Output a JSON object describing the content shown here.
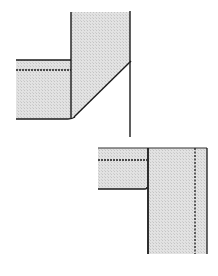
{
  "diagram": {
    "colors": {
      "fill": "#dcdcdc",
      "stroke": "#1a1a1a",
      "background": "#ffffff"
    },
    "figures": [
      {
        "name": "top-figure",
        "parts": [
          "vertical-panel",
          "horizontal-panel",
          "bevel-diagonal",
          "stitch-line-dashed",
          "extended-edge"
        ]
      },
      {
        "name": "bottom-figure",
        "parts": [
          "horizontal-panel",
          "vertical-panel",
          "stitch-line-dashed",
          "stitch-line-dotted"
        ]
      }
    ]
  }
}
